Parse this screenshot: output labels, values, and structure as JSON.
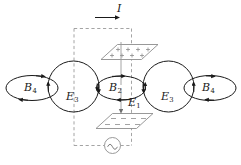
{
  "figure": {
    "stroke_color": "#1a1a1a",
    "dashed_color": "#999999",
    "plate_color": "#8a8a8a",
    "background": "#ffffff"
  },
  "current": {
    "symbol": "I",
    "name": "conduction-current",
    "direction": "right"
  },
  "fields": [
    {
      "id": "B-left",
      "base": "B",
      "sub": "4",
      "kind": "magnetic"
    },
    {
      "id": "E-left",
      "base": "E",
      "sub": "3",
      "kind": "electric"
    },
    {
      "id": "B-center",
      "base": "B",
      "sub": "2",
      "kind": "magnetic"
    },
    {
      "id": "E-center",
      "base": "E",
      "sub": "1",
      "kind": "electric"
    },
    {
      "id": "E-right",
      "base": "E",
      "sub": "3",
      "kind": "electric"
    },
    {
      "id": "B-right",
      "base": "B",
      "sub": "4",
      "kind": "magnetic"
    }
  ],
  "labels": {
    "current": "I",
    "b_left_base": "B",
    "b_left_sub": "4",
    "e_left_base": "E",
    "e_left_sub": "3",
    "b_center_base": "B",
    "b_center_sub": "2",
    "e_center_base": "E",
    "e_center_sub": "1",
    "e_right_base": "E",
    "e_right_sub": "3",
    "b_right_base": "B",
    "b_right_sub": "4"
  },
  "capacitor": {
    "top_plate": {
      "charge_sign": "+",
      "charge_count": 8,
      "name": "positive-plate"
    },
    "bottom_plate": {
      "charge_sign": "–",
      "charge_count": 8,
      "name": "negative-plate"
    }
  },
  "source": {
    "type": "ac-source",
    "glyph": "sine"
  }
}
